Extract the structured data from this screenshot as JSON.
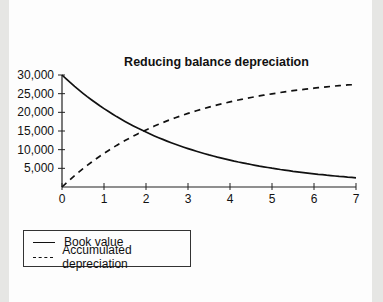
{
  "chart_data": {
    "type": "line",
    "title": "Reducing balance depreciation",
    "xlabel": "",
    "ylabel": "",
    "x": [
      0,
      1,
      2,
      3,
      4,
      5,
      6,
      7
    ],
    "x_ticks": [
      "0",
      "1",
      "2",
      "3",
      "4",
      "5",
      "6",
      "7"
    ],
    "y_ticks": [
      "5,000",
      "10,000",
      "15,000",
      "20,000",
      "25,000",
      "30,000"
    ],
    "ylim": [
      0,
      30000
    ],
    "xlim": [
      0,
      7
    ],
    "grid": false,
    "legend_position": "bottom-left (below plot)",
    "series": [
      {
        "name": "Book value",
        "style": "solid",
        "values": [
          30000,
          21000,
          14700,
          10290,
          7203,
          5042,
          3529,
          2471
        ]
      },
      {
        "name": "Accumulated depreciation",
        "style": "dashed",
        "values": [
          0,
          9000,
          15300,
          19710,
          22797,
          24958,
          26471,
          27529
        ]
      }
    ]
  },
  "legend": {
    "items": [
      {
        "label": "Book value",
        "style": "solid"
      },
      {
        "label": "Accumulated depreciation",
        "style": "dashed"
      }
    ]
  },
  "colors": {
    "line": "#111111",
    "page": "#fdfdfd",
    "margin": "#e6e6e4"
  }
}
